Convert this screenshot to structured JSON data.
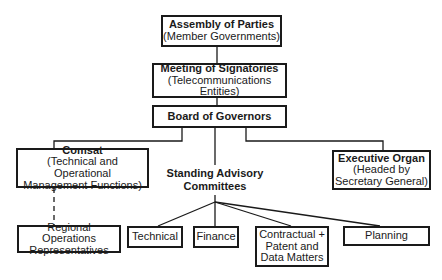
{
  "diagram": {
    "type": "organizational-chart",
    "nodes": {
      "assembly": {
        "title": "Assembly of Parties",
        "subtitle": "(Member Governments)"
      },
      "meeting": {
        "title": "Meeting of Signatories",
        "subtitle_line1": "(Telecommunications",
        "subtitle_line2": "Entities)"
      },
      "board": {
        "title": "Board of Governors"
      },
      "comsat": {
        "title": "Comsat",
        "subtitle_line1": "(Technical and Operational",
        "subtitle_line2": "Management Functions)"
      },
      "executive": {
        "title": "Executive Organ",
        "subtitle_line1": "(Headed by",
        "subtitle_line2": "Secretary General)"
      },
      "standing": {
        "line1": "Standing Advisory",
        "line2": "Committees"
      },
      "regional": {
        "line1": "Regional Operations",
        "line2": "Representatives"
      },
      "technical": {
        "label": "Technical"
      },
      "finance": {
        "label": "Finance"
      },
      "contractual": {
        "line1": "Contractual +",
        "line2": "Patent and",
        "line3": "Data Matters"
      },
      "planning": {
        "label": "Planning"
      }
    },
    "edges": [
      [
        "assembly",
        "meeting"
      ],
      [
        "meeting",
        "board"
      ],
      [
        "board",
        "comsat"
      ],
      [
        "board",
        "standing"
      ],
      [
        "board",
        "executive"
      ],
      [
        "comsat",
        "regional",
        "dashed"
      ],
      [
        "standing",
        "technical"
      ],
      [
        "standing",
        "finance"
      ],
      [
        "standing",
        "contractual"
      ],
      [
        "standing",
        "planning"
      ]
    ]
  }
}
